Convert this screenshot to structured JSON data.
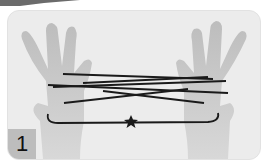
{
  "figure": {
    "step_number": "1",
    "colors": {
      "panel_background": "#ececec",
      "skin": "#cfcfcf",
      "string": "#1a1a1a",
      "badge": "#bdbdbd"
    },
    "marker_icon": "star-icon"
  }
}
